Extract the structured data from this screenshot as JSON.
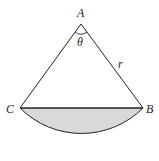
{
  "diagram": {
    "type": "circular-sector-segment",
    "labels": {
      "apex": "A",
      "left": "C",
      "right": "B",
      "angle": "θ",
      "radius": "r"
    },
    "colors": {
      "stroke": "#222222",
      "fill_segment": "#d9d9d9",
      "background": "#ffffff"
    }
  }
}
